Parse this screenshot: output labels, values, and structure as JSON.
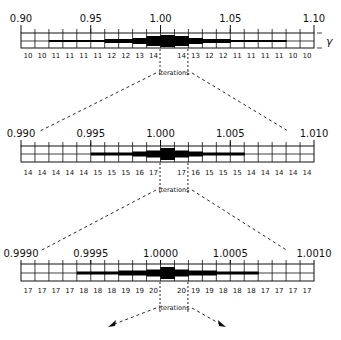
{
  "figure": {
    "symbol": "γ",
    "iterations_label": "Iterations",
    "scales": [
      {
        "id": "coarse",
        "range_labels": [
          "0.90",
          "0.95",
          "1.00",
          "1.05",
          "1.10"
        ],
        "iteration_counts": [
          "10",
          "10",
          "11",
          "11",
          "11",
          "11",
          "12",
          "12",
          "13",
          "14",
          "",
          "14",
          "13",
          "12",
          "12",
          "11",
          "11",
          "11",
          "11",
          "10",
          "10"
        ]
      },
      {
        "id": "medium",
        "range_labels": [
          "0.990",
          "0.995",
          "1.000",
          "1.005",
          "1.010"
        ],
        "iteration_counts": [
          "14",
          "14",
          "14",
          "14",
          "14",
          "15",
          "15",
          "15",
          "16",
          "17",
          "",
          "17",
          "16",
          "15",
          "15",
          "15",
          "14",
          "14",
          "14",
          "14",
          "14"
        ]
      },
      {
        "id": "fine",
        "range_labels": [
          "0.9990",
          "0.9995",
          "1.0000",
          "1.0005",
          "1.0010"
        ],
        "iteration_counts": [
          "17",
          "17",
          "17",
          "17",
          "18",
          "18",
          "18",
          "19",
          "19",
          "20",
          "",
          "20",
          "19",
          "19",
          "18",
          "18",
          "18",
          "17",
          "17",
          "17",
          "17"
        ]
      }
    ]
  }
}
